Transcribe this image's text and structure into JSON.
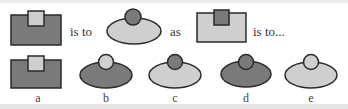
{
  "colors": {
    "dark": "#7a7a7a",
    "light": "#cfcfcf",
    "stroke": "#2a2a2a"
  },
  "question": {
    "text_1": "is to",
    "text_2": "as",
    "text_3": "is to..."
  },
  "options": [
    {
      "label": "a",
      "shape": "rectangle-with-square",
      "base": "dark",
      "top": "light"
    },
    {
      "label": "b",
      "shape": "ellipse-with-circle",
      "base": "dark",
      "top": "light"
    },
    {
      "label": "c",
      "shape": "ellipse-with-circle",
      "base": "light",
      "top": "dark"
    },
    {
      "label": "d",
      "shape": "ellipse-with-circle",
      "base": "dark",
      "top": "dark"
    },
    {
      "label": "e",
      "shape": "ellipse-with-circle",
      "base": "light",
      "top": "light"
    }
  ]
}
